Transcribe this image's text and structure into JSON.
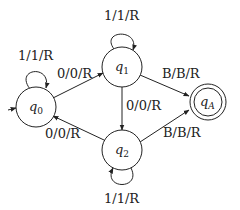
{
  "diagram": {
    "type": "state-machine",
    "title": "",
    "states": [
      {
        "id": "q0",
        "base": "q",
        "sub": "0",
        "start": true,
        "accept": false
      },
      {
        "id": "q1",
        "base": "q",
        "sub": "1",
        "start": false,
        "accept": false
      },
      {
        "id": "q2",
        "base": "q",
        "sub": "2",
        "start": false,
        "accept": false
      },
      {
        "id": "qA",
        "base": "q",
        "sub": "A",
        "start": false,
        "accept": true
      }
    ],
    "transitions": [
      {
        "from": "q0",
        "to": "q0",
        "label": "1/1/R"
      },
      {
        "from": "q0",
        "to": "q1",
        "label": "0/0/R"
      },
      {
        "from": "q1",
        "to": "q1",
        "label": "1/1/R"
      },
      {
        "from": "q1",
        "to": "q2",
        "label": "0/0/R"
      },
      {
        "from": "q1",
        "to": "qA",
        "label": "B/B/R"
      },
      {
        "from": "q2",
        "to": "q0",
        "label": "0/0/R"
      },
      {
        "from": "q2",
        "to": "q2",
        "label": "1/1/R"
      },
      {
        "from": "q2",
        "to": "qA",
        "label": "B/B/R"
      }
    ],
    "colors": {
      "stroke": "#222222",
      "background": "#ffffff"
    }
  }
}
